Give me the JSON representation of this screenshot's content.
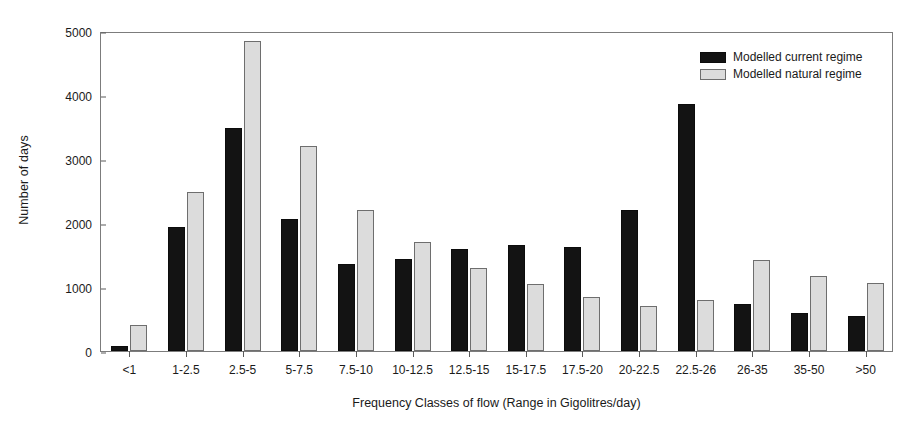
{
  "chart_data": {
    "type": "bar",
    "title": "",
    "xlabel": "Frequency Classes of flow (Range in Gigolitres/day)",
    "ylabel": "Number of days",
    "ylim": [
      0,
      5000
    ],
    "yticks": [
      0,
      1000,
      2000,
      3000,
      4000,
      5000
    ],
    "ytick_labels": [
      "0",
      "1000",
      "2000",
      "3000",
      "4000",
      "5000"
    ],
    "grid": false,
    "legend_position": "top-right",
    "categories": [
      "<1",
      "1-2.5",
      "2.5-5",
      "5-7.5",
      "7.5-10",
      "10-12.5",
      "12.5-15",
      "15-17.5",
      "17.5-20",
      "20-22.5",
      "22.5-26",
      "26-35",
      "35-50",
      ">50"
    ],
    "series": [
      {
        "name": "Modelled current regime",
        "color": "#131313",
        "values": [
          75,
          1940,
          3480,
          2060,
          1360,
          1440,
          1590,
          1660,
          1620,
          2200,
          3860,
          730,
          600,
          545
        ]
      },
      {
        "name": "Modelled natural regime",
        "color": "#dcdcdc",
        "values": [
          400,
          2490,
          4840,
          3200,
          2200,
          1700,
          1300,
          1050,
          850,
          700,
          790,
          1420,
          1170,
          1070
        ]
      }
    ]
  },
  "legend": {
    "items": [
      {
        "label": "Modelled current regime",
        "swatch": "current"
      },
      {
        "label": "Modelled natural regime",
        "swatch": "natural"
      }
    ]
  }
}
